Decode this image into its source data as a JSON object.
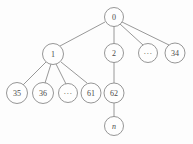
{
  "figure": {
    "background_color": "#fdfdfd",
    "stroke_color": "#8a8a8a",
    "label_color": "#4a4a4a"
  },
  "diagram": {
    "type": "tree",
    "nodes": [
      {
        "id": "root",
        "label": "0",
        "cx": 114,
        "cy": 17,
        "r": 9.5,
        "style": "normal"
      },
      {
        "id": "n1",
        "label": "1",
        "cx": 53,
        "cy": 54,
        "r": 10.5,
        "style": "normal"
      },
      {
        "id": "n2",
        "label": "2",
        "cx": 114,
        "cy": 53,
        "r": 9.5,
        "style": "normal"
      },
      {
        "id": "ndots1",
        "label": "···",
        "cx": 148,
        "cy": 53,
        "r": 9.5,
        "style": "ellipsis"
      },
      {
        "id": "n34",
        "label": "34",
        "cx": 175,
        "cy": 53,
        "r": 10.0,
        "style": "normal"
      },
      {
        "id": "n35",
        "label": "35",
        "cx": 17,
        "cy": 93,
        "r": 10.5,
        "style": "normal"
      },
      {
        "id": "n36",
        "label": "36",
        "cx": 43,
        "cy": 93,
        "r": 10.5,
        "style": "normal"
      },
      {
        "id": "ndots2",
        "label": "···",
        "cx": 68,
        "cy": 93,
        "r": 9.5,
        "style": "ellipsis"
      },
      {
        "id": "n61",
        "label": "61",
        "cx": 91,
        "cy": 93,
        "r": 10.0,
        "style": "normal"
      },
      {
        "id": "n62",
        "label": "62",
        "cx": 114,
        "cy": 93,
        "r": 10.0,
        "style": "normal"
      },
      {
        "id": "nn",
        "label": "n",
        "cx": 114,
        "cy": 126,
        "r": 9.5,
        "style": "italic"
      }
    ],
    "edges": [
      {
        "from": "root",
        "to": "n1",
        "x1": 105,
        "y1": 22,
        "x2": 60,
        "y2": 46
      },
      {
        "from": "root",
        "to": "n2",
        "x1": 114,
        "y1": 26,
        "x2": 114,
        "y2": 44
      },
      {
        "from": "root",
        "to": "ndots1",
        "x1": 120,
        "y1": 24,
        "x2": 143,
        "y2": 45
      },
      {
        "from": "root",
        "to": "n34",
        "x1": 122,
        "y1": 22,
        "x2": 169,
        "y2": 45
      },
      {
        "from": "n1",
        "to": "n35",
        "x1": 46,
        "y1": 62,
        "x2": 23,
        "y2": 85
      },
      {
        "from": "n1",
        "to": "n36",
        "x1": 51,
        "y1": 64,
        "x2": 45,
        "y2": 83
      },
      {
        "from": "n1",
        "to": "ndots2",
        "x1": 56,
        "y1": 64,
        "x2": 66,
        "y2": 84
      },
      {
        "from": "n1",
        "to": "n61",
        "x1": 61,
        "y1": 62,
        "x2": 87,
        "y2": 83
      },
      {
        "from": "n2",
        "to": "n62",
        "x1": 114,
        "y1": 62,
        "x2": 114,
        "y2": 83
      },
      {
        "from": "n62",
        "to": "nn",
        "x1": 114,
        "y1": 103,
        "x2": 114,
        "y2": 117
      }
    ]
  }
}
